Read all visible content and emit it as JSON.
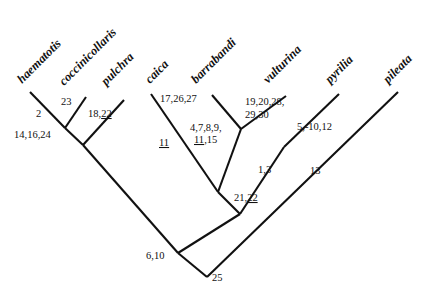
{
  "figure": {
    "type": "phylogenetic-cladogram",
    "background_color": "#ffffff",
    "line_color": "#111111",
    "text_color": "#111111"
  },
  "taxa": [
    {
      "id": "haematotis",
      "label": "haematotis",
      "x": 22,
      "y": 84,
      "rotation": -45
    },
    {
      "id": "coccinicollaris",
      "label": "coccinicollaris",
      "x": 64,
      "y": 86,
      "rotation": -45
    },
    {
      "id": "pulchra",
      "label": "pulchra",
      "x": 106,
      "y": 86,
      "rotation": -45
    },
    {
      "id": "caica",
      "label": "caica",
      "x": 150,
      "y": 84,
      "rotation": -45
    },
    {
      "id": "barrabandi",
      "label": "barrabandi",
      "x": 196,
      "y": 84,
      "rotation": -45
    },
    {
      "id": "vulturina",
      "label": "vulturina",
      "x": 268,
      "y": 84,
      "rotation": -45
    },
    {
      "id": "pyrilia",
      "label": "pyrilia",
      "x": 330,
      "y": 84,
      "rotation": -45
    },
    {
      "id": "pileata",
      "label": "pileata",
      "x": 388,
      "y": 84,
      "rotation": -45
    }
  ],
  "branch_labels": [
    {
      "id": "node-2",
      "text": "2",
      "x": 36,
      "y": 117,
      "underline": ""
    },
    {
      "id": "branch-23",
      "text": "23",
      "x": 61,
      "y": 105,
      "underline": ""
    },
    {
      "id": "branch-18-22",
      "text": "18,22",
      "x": 88,
      "y": 117,
      "underline": "22"
    },
    {
      "id": "node-14-16-24",
      "text": "14,16,24",
      "x": 14,
      "y": 138,
      "underline": ""
    },
    {
      "id": "branch-17-26-27",
      "text": "17,26,27",
      "x": 160,
      "y": 102,
      "underline": ""
    },
    {
      "id": "branch-11",
      "text": "11",
      "x": 159,
      "y": 146,
      "underline": "11"
    },
    {
      "id": "node-4-7-8-9",
      "text": "4,7,8,9,",
      "x": 190,
      "y": 131,
      "underline": ""
    },
    {
      "id": "node-11-15",
      "text": "11,15",
      "x": 194,
      "y": 143,
      "underline": "11"
    },
    {
      "id": "branch-19-20-28",
      "text": "19,20,28,",
      "x": 245,
      "y": 105,
      "underline": ""
    },
    {
      "id": "branch-29-30",
      "text": "29,30",
      "x": 245,
      "y": 118,
      "underline": ""
    },
    {
      "id": "branch-5-10-12",
      "text": "5,-10,12",
      "x": 297,
      "y": 130,
      "underline": ""
    },
    {
      "id": "node-1-3",
      "text": "1,3",
      "x": 258,
      "y": 173,
      "underline": ""
    },
    {
      "id": "branch-13",
      "text": "13",
      "x": 310,
      "y": 174,
      "underline": ""
    },
    {
      "id": "node-21-22",
      "text": "21,22",
      "x": 234,
      "y": 201,
      "underline": "22"
    },
    {
      "id": "node-6-10",
      "text": "6,10",
      "x": 146,
      "y": 259,
      "underline": ""
    },
    {
      "id": "node-25",
      "text": "25",
      "x": 212,
      "y": 281,
      "underline": ""
    }
  ],
  "branches": [
    {
      "id": "tip-haematotis",
      "x1": 30,
      "y1": 92,
      "x2": 65,
      "y2": 128
    },
    {
      "id": "tip-coccinicollaris",
      "x1": 86,
      "y1": 97,
      "x2": 65,
      "y2": 128
    },
    {
      "id": "internal-node2-to-14",
      "x1": 65,
      "y1": 128,
      "x2": 83,
      "y2": 145
    },
    {
      "id": "tip-pulchra",
      "x1": 124,
      "y1": 100,
      "x2": 83,
      "y2": 145
    },
    {
      "id": "internal-14-to-610",
      "x1": 83,
      "y1": 145,
      "x2": 178,
      "y2": 253
    },
    {
      "id": "tip-caica",
      "x1": 151,
      "y1": 94,
      "x2": 218,
      "y2": 192
    },
    {
      "id": "tip-barrabandi",
      "x1": 212,
      "y1": 95,
      "x2": 241,
      "y2": 129
    },
    {
      "id": "internal-barr-node",
      "x1": 241,
      "y1": 129,
      "x2": 218,
      "y2": 192
    },
    {
      "id": "tip-vulturina",
      "x1": 286,
      "y1": 96,
      "x2": 241,
      "y2": 129
    },
    {
      "id": "internal-17-to-2122",
      "x1": 218,
      "y1": 192,
      "x2": 240,
      "y2": 214
    },
    {
      "id": "internal-13-to-2122",
      "x1": 284,
      "y1": 147,
      "x2": 240,
      "y2": 214
    },
    {
      "id": "tip-pyrilia",
      "x1": 339,
      "y1": 94,
      "x2": 284,
      "y2": 147
    },
    {
      "id": "internal-2122-to-610",
      "x1": 240,
      "y1": 214,
      "x2": 178,
      "y2": 253
    },
    {
      "id": "internal-610-to-root",
      "x1": 178,
      "y1": 253,
      "x2": 207,
      "y2": 277
    },
    {
      "id": "tip-pileata",
      "x1": 398,
      "y1": 92,
      "x2": 207,
      "y2": 277
    }
  ]
}
